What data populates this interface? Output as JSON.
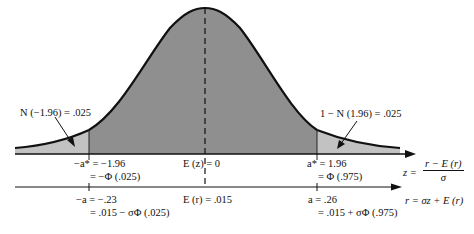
{
  "diagram": {
    "colors": {
      "center_fill": "#8f8f8f",
      "tail_fill": "#c2c2c2",
      "curve": "#111111",
      "axis": "#111111"
    },
    "annotations": {
      "left_tail": "N (−1.96) = .025",
      "right_tail": "1 − N (1.96) = .025"
    },
    "z_axis": {
      "left_line1": "−a* = −1.96",
      "left_line2": "= −Φ (.025)",
      "center": "E (z) = 0",
      "right_line1": "a* = 1.96",
      "right_line2": "= Φ (.975)"
    },
    "r_axis": {
      "left_line1": "−a = −.23",
      "left_line2": "= .015 − σΦ (.025)",
      "center": "E (r) = .015",
      "right_line1": "a = .26",
      "right_line2": "= .015 + σΦ (.975)"
    },
    "formulas": {
      "z_lhs": "z =",
      "z_num": "r − E (r)",
      "z_den": "σ",
      "r_eq": "r = σz + E (r)"
    }
  }
}
